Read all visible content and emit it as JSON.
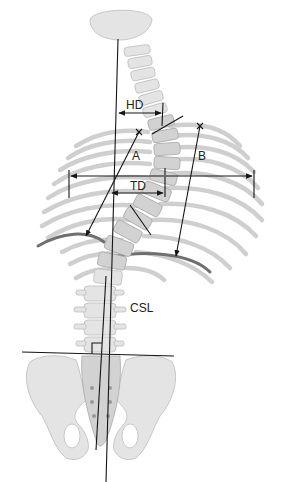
{
  "diagram": {
    "type": "anatomical-measurement-diagram",
    "labels": {
      "hd": "HD",
      "a": "A",
      "b": "B",
      "td": "TD",
      "csl": "CSL"
    },
    "measurements": [
      {
        "id": "HD",
        "description": "horizontal arrow between plumb line from skull and cervicothoracic spine"
      },
      {
        "id": "A",
        "description": "arrow from upper-left X mark down to highlighted left rib"
      },
      {
        "id": "B",
        "description": "arrow from upper-right X mark down to highlighted right rib"
      },
      {
        "id": "TD",
        "description": "horizontal arrow from plumb line to thoracic apex"
      },
      {
        "id": "CSL",
        "description": "central sacral line, vertical through sacrum perpendicular to pelvic line"
      }
    ],
    "colors": {
      "line": "#151515",
      "bone": "#e4e4e4",
      "bone_outline": "#bdbdbd",
      "highlight_rib": "#6f6f6f",
      "background": "#ffffff"
    }
  }
}
